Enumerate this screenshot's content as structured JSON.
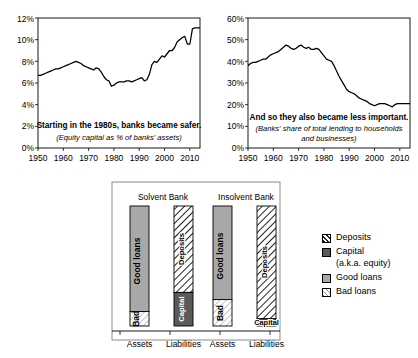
{
  "chart_data": [
    {
      "type": "line",
      "title": "Starting in the 1980s, banks became safer.",
      "subtitle": "(Equity capital as % of banks' assets)",
      "xlabel": "",
      "ylabel": "",
      "ylim": [
        0,
        12
      ],
      "xlim": [
        1950,
        2014
      ],
      "grid": false,
      "yticks": [
        "0%",
        "2%",
        "4%",
        "6%",
        "8%",
        "10%",
        "12%"
      ],
      "ytick_values": [
        0,
        2,
        4,
        6,
        8,
        10,
        12
      ],
      "xticks": [
        "1950",
        "1960",
        "1970",
        "1980",
        "1990",
        "2000",
        "2010"
      ],
      "xtick_values": [
        1950,
        1960,
        1970,
        1980,
        1990,
        2000,
        2010
      ],
      "series": [
        {
          "name": "Equity capital as % of banks' assets",
          "x": [
            1950,
            1951,
            1952,
            1953,
            1954,
            1955,
            1956,
            1957,
            1958,
            1959,
            1960,
            1961,
            1962,
            1963,
            1964,
            1965,
            1966,
            1967,
            1968,
            1969,
            1970,
            1971,
            1972,
            1973,
            1974,
            1975,
            1976,
            1977,
            1978,
            1979,
            1980,
            1981,
            1982,
            1983,
            1984,
            1985,
            1986,
            1987,
            1988,
            1989,
            1990,
            1991,
            1992,
            1993,
            1994,
            1995,
            1996,
            1997,
            1998,
            1999,
            2000,
            2001,
            2002,
            2003,
            2004,
            2005,
            2006,
            2007,
            2008,
            2009,
            2010,
            2011,
            2012,
            2013,
            2014
          ],
          "values": [
            6.7,
            6.7,
            6.8,
            6.9,
            7.0,
            7.1,
            7.2,
            7.3,
            7.3,
            7.4,
            7.5,
            7.6,
            7.7,
            7.8,
            7.9,
            8.0,
            7.9,
            7.8,
            7.6,
            7.5,
            7.4,
            7.3,
            7.2,
            7.4,
            7.3,
            7.0,
            6.6,
            6.3,
            6.2,
            5.7,
            5.8,
            6.0,
            6.1,
            6.1,
            6.1,
            6.2,
            6.2,
            6.1,
            6.2,
            6.3,
            6.4,
            6.5,
            6.2,
            6.3,
            6.8,
            7.7,
            8.0,
            7.9,
            8.2,
            8.5,
            8.4,
            8.7,
            9.0,
            9.0,
            9.3,
            9.8,
            10.0,
            10.2,
            10.3,
            9.6,
            9.6,
            11.0,
            11.1,
            11.1,
            11.1
          ]
        }
      ]
    },
    {
      "type": "line",
      "title": "And so they also became less important.",
      "subtitle": "(Banks' share of total lending to households and businesses)",
      "xlabel": "",
      "ylabel": "",
      "ylim": [
        0,
        60
      ],
      "xlim": [
        1950,
        2014
      ],
      "grid": false,
      "yticks": [
        "0%",
        "10%",
        "20%",
        "30%",
        "40%",
        "50%",
        "60%"
      ],
      "ytick_values": [
        0,
        10,
        20,
        30,
        40,
        50,
        60
      ],
      "xticks": [
        "1950",
        "1960",
        "1970",
        "1980",
        "1990",
        "2000",
        "2010"
      ],
      "xtick_values": [
        1950,
        1960,
        1970,
        1980,
        1990,
        2000,
        2010
      ],
      "series": [
        {
          "name": "Banks' share of total lending to households and businesses",
          "x": [
            1950,
            1951,
            1952,
            1953,
            1954,
            1955,
            1956,
            1957,
            1958,
            1959,
            1960,
            1961,
            1962,
            1963,
            1964,
            1965,
            1966,
            1967,
            1968,
            1969,
            1970,
            1971,
            1972,
            1973,
            1974,
            1975,
            1976,
            1977,
            1978,
            1979,
            1980,
            1981,
            1982,
            1983,
            1984,
            1985,
            1986,
            1987,
            1988,
            1989,
            1990,
            1991,
            1992,
            1993,
            1994,
            1995,
            1996,
            1997,
            1998,
            1999,
            2000,
            2001,
            2002,
            2003,
            2004,
            2005,
            2006,
            2007,
            2008,
            2009,
            2010,
            2011,
            2012,
            2013,
            2014
          ],
          "values": [
            38.0,
            39.0,
            39.5,
            39.5,
            40.0,
            40.5,
            41.0,
            41.0,
            42.0,
            43.0,
            43.5,
            44.0,
            44.5,
            45.5,
            46.5,
            47.5,
            47.0,
            46.0,
            45.5,
            46.0,
            47.0,
            47.5,
            46.5,
            46.0,
            46.5,
            45.5,
            45.5,
            46.0,
            45.5,
            44.0,
            42.5,
            41.0,
            40.5,
            40.0,
            38.0,
            35.5,
            33.0,
            31.0,
            29.0,
            27.0,
            26.0,
            25.5,
            25.0,
            24.0,
            23.0,
            22.5,
            22.0,
            21.5,
            20.5,
            20.0,
            19.5,
            20.0,
            20.5,
            20.5,
            20.5,
            20.0,
            19.5,
            19.0,
            20.0,
            20.5,
            20.5,
            20.5,
            20.5,
            20.5,
            20.5
          ]
        }
      ]
    },
    {
      "type": "bar",
      "title": "",
      "chart_subtype": "stacked-balance-sheet",
      "panels": [
        {
          "name": "Solvent Bank",
          "bars": [
            {
              "axis_label": "Assets",
              "segments": [
                {
                  "label": "Good loans",
                  "value": 88,
                  "fill": "good-loans"
                },
                {
                  "label": "Bad",
                  "value": 12,
                  "fill": "bad-loans"
                }
              ]
            },
            {
              "axis_label": "Liabilities",
              "segments": [
                {
                  "label": "Deposits",
                  "value": 72,
                  "fill": "deposits"
                },
                {
                  "label": "Capital",
                  "value": 28,
                  "fill": "capital"
                }
              ]
            }
          ]
        },
        {
          "name": "Insolvent Bank",
          "bars": [
            {
              "axis_label": "Assets",
              "segments": [
                {
                  "label": "Good loans",
                  "value": 78,
                  "fill": "good-loans"
                },
                {
                  "label": "Bad",
                  "value": 22,
                  "fill": "bad-loans"
                }
              ]
            },
            {
              "axis_label": "Liabilities",
              "segments": [
                {
                  "label": "Deposits",
                  "value": 94,
                  "fill": "deposits"
                },
                {
                  "label": "Capital",
                  "value": 6,
                  "fill": "capital"
                }
              ]
            }
          ]
        }
      ],
      "legend": {
        "position": "right",
        "entries": [
          {
            "label": "Deposits",
            "sub": "",
            "fill": "deposits"
          },
          {
            "label": "Capital",
            "sub": "(a.k.a. equity)",
            "fill": "capital"
          },
          {
            "label": "Good loans",
            "sub": "",
            "fill": "good-loans"
          },
          {
            "label": "Bad loans",
            "sub": "",
            "fill": "bad-loans"
          }
        ]
      }
    }
  ],
  "colors": {
    "line": "#000000",
    "axis": "#000000",
    "good_loans": "#a8a8a8",
    "capital": "#555555",
    "bad_loans": "#f2f2f2",
    "deposits": "#ffffff",
    "panel_border": "#7a7a7a"
  }
}
